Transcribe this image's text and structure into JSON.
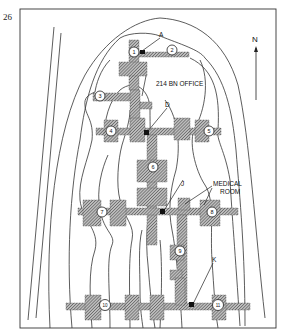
{
  "figure": {
    "number": "26",
    "north_label": "N"
  },
  "labels": {
    "a": "A",
    "d": "D",
    "j": "J",
    "k": "K",
    "bn_office": "214 BN OFFICE",
    "medical_line1": "MEDICAL",
    "medical_line2": "ROOM"
  },
  "posts": [
    {
      "id": "1",
      "label": "1"
    },
    {
      "id": "2",
      "label": "2"
    },
    {
      "id": "3",
      "label": "3"
    },
    {
      "id": "4",
      "label": "4"
    },
    {
      "id": "5",
      "label": "5"
    },
    {
      "id": "6",
      "label": "6"
    },
    {
      "id": "7",
      "label": "7"
    },
    {
      "id": "8",
      "label": "8"
    },
    {
      "id": "9",
      "label": "9"
    },
    {
      "id": "10",
      "label": "10"
    },
    {
      "id": "11",
      "label": "11"
    }
  ]
}
